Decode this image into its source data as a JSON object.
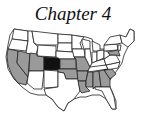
{
  "title": "Chapter 4",
  "map": {
    "region": "United States",
    "highlighted_primary": {
      "states": [
        "Colorado"
      ],
      "color": "#111111"
    },
    "highlighted_secondary": {
      "states": [
        "California",
        "Nevada",
        "Utah",
        "Kansas",
        "Missouri",
        "Oklahoma",
        "Arkansas",
        "Louisiana",
        "Mississippi",
        "Alabama",
        "Georgia",
        "South Carolina",
        "Maryland",
        "Delaware"
      ],
      "color": "#9a9a9a"
    },
    "default_color": "#ffffff",
    "border_color": "#222222"
  }
}
